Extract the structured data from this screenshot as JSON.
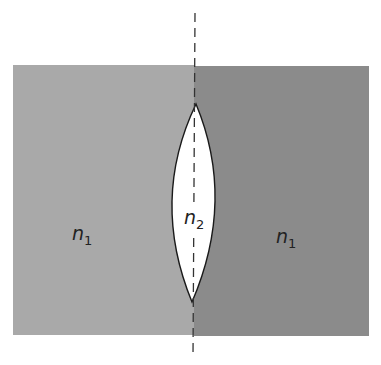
{
  "diagram": {
    "type": "biconvex lens between two media",
    "colors": {
      "left_medium": "#a8a8a8",
      "right_medium": "#8a8a8a",
      "lens": "#ffffff",
      "outline": "#1a1a1a",
      "axis": "#333333"
    },
    "labels": {
      "left_medium": {
        "base": "n",
        "sub": "1"
      },
      "lens": {
        "base": "n",
        "sub": "2"
      },
      "right_medium": {
        "base": "n",
        "sub": "1"
      }
    }
  }
}
